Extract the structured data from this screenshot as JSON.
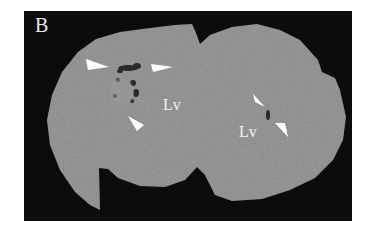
{
  "figure": {
    "panel_label": "B",
    "labels": {
      "left_ventricle": "Lv",
      "right_ventricle": "Lv"
    },
    "colors": {
      "background": "#ffffff",
      "frame": "#0c0c0c",
      "tissue": "#8a8a8a",
      "lesion": "#2a2a2a",
      "arrow": "#ffffff"
    },
    "arrows": [
      {
        "id": "arrow-top-left",
        "direction": "right"
      },
      {
        "id": "arrow-top-right",
        "direction": "left"
      },
      {
        "id": "arrow-bottom-left",
        "direction": "up-left"
      },
      {
        "id": "arrowhead-right-upper",
        "direction": "down-right"
      },
      {
        "id": "arrowhead-right-lower",
        "direction": "up-left"
      }
    ]
  }
}
